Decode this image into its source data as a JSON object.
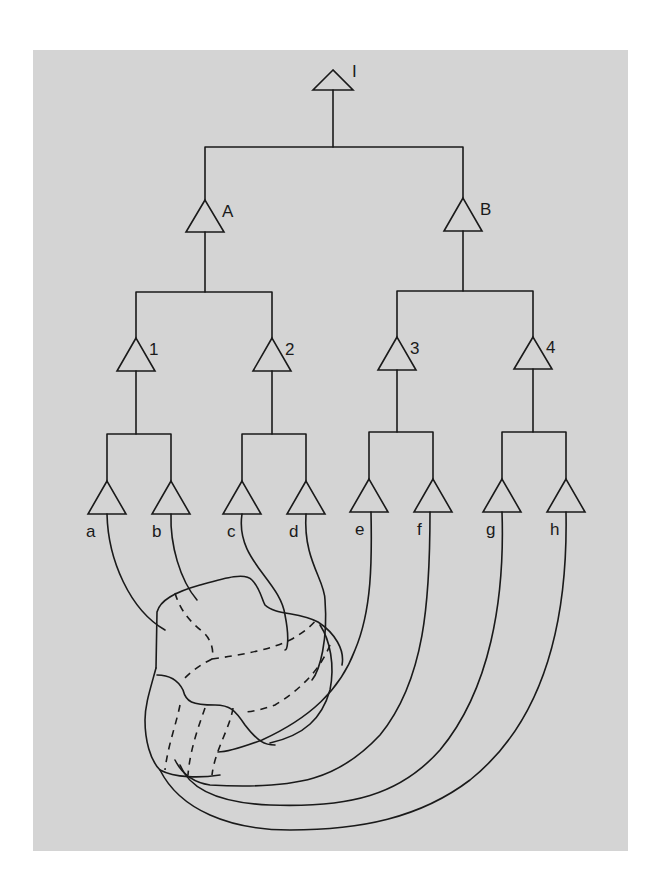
{
  "diagram": {
    "colors": {
      "background": "#d4d4d4",
      "stroke": "#1a1a1a",
      "page": "#ffffff"
    },
    "root": {
      "label": "I"
    },
    "level1": [
      {
        "label": "A"
      },
      {
        "label": "B"
      }
    ],
    "level2": [
      {
        "label": "1"
      },
      {
        "label": "2"
      },
      {
        "label": "3"
      },
      {
        "label": "4"
      }
    ],
    "leaves": [
      {
        "label": "a"
      },
      {
        "label": "b"
      },
      {
        "label": "c"
      },
      {
        "label": "d"
      },
      {
        "label": "e"
      },
      {
        "label": "f"
      },
      {
        "label": "g"
      },
      {
        "label": "h"
      }
    ]
  }
}
